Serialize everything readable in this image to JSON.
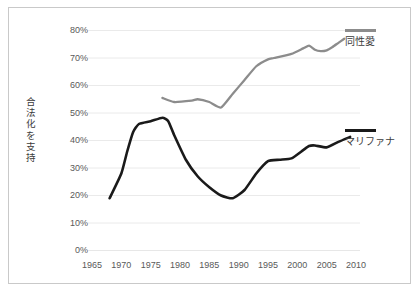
{
  "chart_data": {
    "type": "line",
    "title": "",
    "subtitle": "",
    "xlabel": "",
    "ylabel": "合法化を支持",
    "xlim": [
      1963,
      2012
    ],
    "ylim": [
      0,
      80
    ],
    "grid": true,
    "legend_position": "right",
    "x_ticks": [
      "1965",
      "1970",
      "1975",
      "1980",
      "1985",
      "1990",
      "1995",
      "2000",
      "2005",
      "2010"
    ],
    "x_tick_values": [
      1965,
      1970,
      1975,
      1980,
      1985,
      1990,
      1995,
      2000,
      2005,
      2010
    ],
    "y_ticks": [
      "0%",
      "10%",
      "20%",
      "30%",
      "40%",
      "50%",
      "60%",
      "70%",
      "80%"
    ],
    "y_tick_values": [
      0,
      10,
      20,
      30,
      40,
      50,
      60,
      70,
      80
    ],
    "series": [
      {
        "name": "同性愛",
        "color": "#8c8c8c",
        "x": [
          1977,
          1979,
          1982,
          1983,
          1985,
          1987,
          1989,
          1991,
          1993,
          1995,
          1996,
          1999,
          2001,
          2002,
          2003,
          2004,
          2005,
          2006,
          2007,
          2008
        ],
        "values": [
          55.5,
          54.0,
          54.5,
          55.0,
          54.0,
          52.0,
          57.0,
          62.0,
          67.0,
          69.5,
          70.0,
          71.5,
          73.5,
          74.5,
          73.0,
          72.5,
          72.8,
          74.0,
          75.5,
          77.0
        ]
      },
      {
        "name": "マリファナ",
        "color": "#1a1a1a",
        "x": [
          1968,
          1970,
          1971,
          1972,
          1973,
          1975,
          1977,
          1978,
          1979,
          1981,
          1983,
          1985,
          1987,
          1989,
          1991,
          1993,
          1995,
          1997,
          1999,
          2001,
          2002,
          2003,
          2005,
          2007,
          2009
        ],
        "values": [
          19.0,
          28.0,
          36.0,
          43.0,
          46.0,
          47.0,
          48.3,
          47.0,
          42.0,
          33.0,
          27.0,
          23.0,
          20.0,
          19.0,
          22.0,
          28.0,
          32.5,
          33.0,
          33.5,
          36.5,
          38.0,
          38.2,
          37.5,
          39.5,
          41.3
        ]
      }
    ]
  },
  "legend": [
    {
      "label": "同性愛",
      "color": "#8c8c8c"
    },
    {
      "label": "マリファナ",
      "color": "#1a1a1a"
    }
  ],
  "axis": {
    "y_title": "合法化を支持"
  }
}
